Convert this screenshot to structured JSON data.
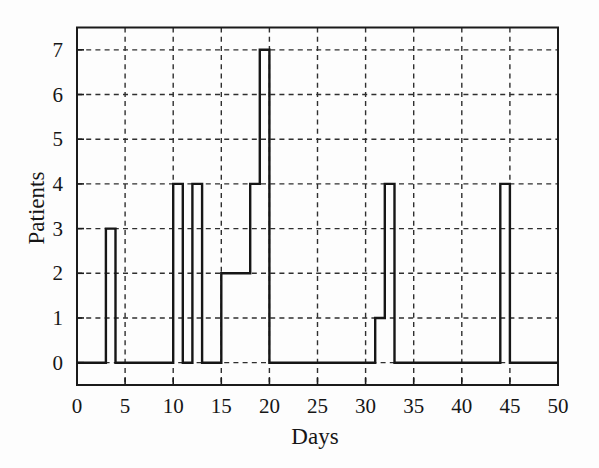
{
  "figure": {
    "background_color": "#fdfdfd",
    "line_color": "#161616",
    "grid_color": "#2f2f2f"
  },
  "chart_data": {
    "type": "line",
    "subtype": "step",
    "title": "",
    "xlabel": "Days",
    "ylabel": "Patients",
    "xlim": [
      0,
      50
    ],
    "ylim": [
      -0.5,
      7.5
    ],
    "xticks": [
      0,
      5,
      10,
      15,
      20,
      25,
      30,
      35,
      40,
      45,
      50
    ],
    "yticks": [
      0,
      1,
      2,
      3,
      4,
      5,
      6,
      7
    ],
    "grid": "dashed, both axes, at every tick",
    "legend": "none",
    "series_name": "Patients present",
    "segments": [
      {
        "from": 0,
        "to": 3,
        "value": 0
      },
      {
        "from": 3,
        "to": 4,
        "value": 3
      },
      {
        "from": 4,
        "to": 10,
        "value": 0
      },
      {
        "from": 10,
        "to": 11,
        "value": 4
      },
      {
        "from": 11,
        "to": 12,
        "value": 0
      },
      {
        "from": 12,
        "to": 13,
        "value": 4
      },
      {
        "from": 13,
        "to": 15,
        "value": 0
      },
      {
        "from": 15,
        "to": 18,
        "value": 2
      },
      {
        "from": 18,
        "to": 19,
        "value": 4
      },
      {
        "from": 19,
        "to": 20,
        "value": 7
      },
      {
        "from": 20,
        "to": 31,
        "value": 0
      },
      {
        "from": 31,
        "to": 32,
        "value": 1
      },
      {
        "from": 32,
        "to": 33,
        "value": 4
      },
      {
        "from": 33,
        "to": 44,
        "value": 0
      },
      {
        "from": 44,
        "to": 45,
        "value": 4
      },
      {
        "from": 45,
        "to": 50,
        "value": 0
      }
    ]
  }
}
